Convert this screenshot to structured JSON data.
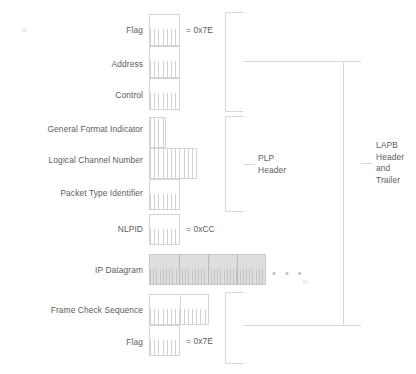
{
  "diagram": {
    "colors": {
      "text": "#5c5c5c",
      "line": "#d4d4d4",
      "shaded_fill": "#dededd",
      "background": "#ffffff"
    },
    "fields": [
      {
        "id": "flag-top",
        "label": "Flag",
        "value": "= 0x7E",
        "cells": 1,
        "shaded": false
      },
      {
        "id": "address",
        "label": "Address",
        "value": "",
        "cells": 1,
        "shaded": false
      },
      {
        "id": "control",
        "label": "Control",
        "value": "",
        "cells": 1,
        "shaded": false
      },
      {
        "id": "gfi",
        "label": "General Format Indicator",
        "value": "",
        "cells": 0.5,
        "shaded": false
      },
      {
        "id": "lcn",
        "label": "Logical Channel Number",
        "value": "",
        "cells": 1.5,
        "shaded": false
      },
      {
        "id": "pti",
        "label": "Packet Type Identifier",
        "value": "",
        "cells": 1,
        "shaded": false
      },
      {
        "id": "nlpid",
        "label": "NLPID",
        "value": "= 0xCC",
        "cells": 1,
        "shaded": false
      },
      {
        "id": "ip-datagram",
        "label": "IP Datagram",
        "value": "",
        "cells": 4,
        "shaded": true
      },
      {
        "id": "fcs",
        "label": "Frame Check Sequence",
        "value": "",
        "cells": 2,
        "shaded": false
      },
      {
        "id": "flag-bottom",
        "label": "Flag",
        "value": "= 0x7E",
        "cells": 1,
        "shaded": false
      }
    ],
    "brackets": [
      {
        "id": "plp-header",
        "label": "PLP\nHeader"
      },
      {
        "id": "lapb-header-trailer",
        "label": "LAPB\nHeader\nand\nTrailer"
      }
    ],
    "labels": {
      "flag_top": "Flag",
      "address": "Address",
      "control": "Control",
      "gfi": "General Format Indicator",
      "lcn": "Logical Channel Number",
      "pti": "Packet Type Identifier",
      "nlpid": "NLPID",
      "ip_datagram": "IP Datagram",
      "fcs": "Frame Check Sequence",
      "flag_bottom": "Flag"
    },
    "values": {
      "flag_top": "= 0x7E",
      "nlpid": "= 0xCC",
      "flag_bottom": "= 0x7E"
    },
    "bracket_labels": {
      "plp_line1": "PLP",
      "plp_line2": "Header",
      "lapb_line1": "LAPB",
      "lapb_line2": "Header",
      "lapb_line3": "and",
      "lapb_line4": "Trailer"
    },
    "continuation": "• • •"
  }
}
